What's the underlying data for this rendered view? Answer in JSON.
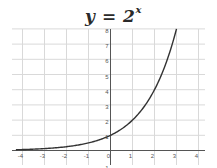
{
  "chart_data": {
    "type": "line",
    "title_parts": {
      "lhs": "y",
      "eq": " = ",
      "base": "2",
      "exponent": "x"
    },
    "function": "2^x",
    "xlabel": "",
    "ylabel": "",
    "xlim": [
      -4.4,
      4.3
    ],
    "ylim": [
      -1,
      8.1
    ],
    "grid": true,
    "legend": null,
    "x_ticks": [
      "-4",
      "-3",
      "-2",
      "-1",
      "0",
      "1",
      "2",
      "3",
      "4"
    ],
    "y_ticks": [
      "-1",
      "1",
      "2",
      "3",
      "4",
      "5",
      "6",
      "7",
      "8"
    ],
    "series": [
      {
        "name": "y = 2^x",
        "x": [
          -4.3,
          -4,
          -3,
          -2,
          -1,
          0,
          1,
          2,
          2.5,
          3
        ],
        "y": [
          0.05,
          0.0625,
          0.125,
          0.25,
          0.5,
          1,
          2,
          4,
          5.66,
          8
        ],
        "color": "#333333"
      }
    ]
  },
  "colors": {
    "grid": "#d9d9d9",
    "axis": "#555555",
    "curve": "#333333"
  }
}
